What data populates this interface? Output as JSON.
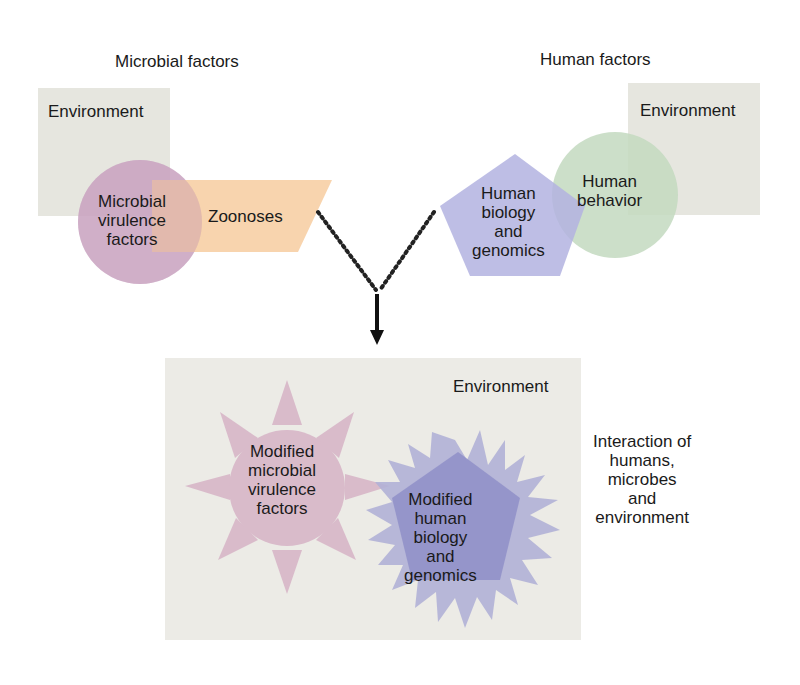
{
  "microbial": {
    "heading": "Microbial factors",
    "environment": "Environment",
    "virulence": [
      "Microbial",
      "virulence",
      "factors"
    ],
    "zoonoses": "Zoonoses"
  },
  "human": {
    "heading": "Human factors",
    "environment": "Environment",
    "biology": [
      "Human",
      "biology",
      "and",
      "genomics"
    ],
    "behavior": [
      "Human",
      "behavior"
    ]
  },
  "combined": {
    "environment": "Environment",
    "microbial": [
      "Modified",
      "microbial",
      "virulence",
      "factors"
    ],
    "human": [
      "Modified",
      "human",
      "biology",
      "and",
      "genomics"
    ],
    "caption": [
      "Interaction of",
      "humans,",
      "microbes",
      "and",
      "environment"
    ]
  },
  "colors": {
    "environment": "#e6e6df",
    "environment_bottom": "#ecebe6",
    "microbial_circle": "#c9a3c0",
    "zoonoses": "#f6c99a",
    "human_pentagon": "#b3b3e0",
    "human_behavior": "#c3d9c0",
    "mod_microbial": "#d8b6c8",
    "mod_human_star": "#b1b1d6",
    "mod_human_pentagon": "#8f8fc8",
    "connector": "#222222"
  }
}
